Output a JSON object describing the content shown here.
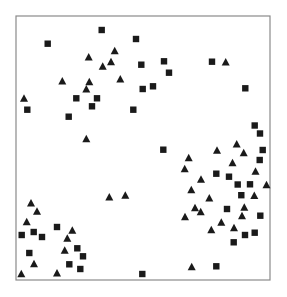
{
  "chart_data": {
    "type": "scatter",
    "title": "",
    "xlabel": "",
    "ylabel": "",
    "grid": false,
    "legend": null,
    "frame": {
      "left": 16,
      "top": 16,
      "right": 270,
      "bottom": 280,
      "stroke": "#8a8a8a"
    },
    "coordinate_system": "pixel (image coordinates, origin top-left)",
    "marker_color": "#1a1a1a",
    "series": [
      {
        "name": "squares",
        "marker": "square",
        "points": [
          [
            47.7,
            43.7
          ],
          [
            101.7,
            30
          ],
          [
            136,
            39
          ],
          [
            141.3,
            64.7
          ],
          [
            142.7,
            89
          ],
          [
            27.3,
            109.7
          ],
          [
            76.3,
            98.3
          ],
          [
            97,
            98.3
          ],
          [
            92,
            106.3
          ],
          [
            68.7,
            116.7
          ],
          [
            133.3,
            109.7
          ],
          [
            164,
            61.3
          ],
          [
            169,
            72.7
          ],
          [
            153,
            86.3
          ],
          [
            212,
            61.7
          ],
          [
            245.3,
            88.3
          ],
          [
            254.7,
            125.5
          ],
          [
            260,
            133.5
          ],
          [
            163.3,
            149.7
          ],
          [
            262.7,
            150
          ],
          [
            259.7,
            160
          ],
          [
            216.3,
            173.7
          ],
          [
            229,
            176.7
          ],
          [
            237.7,
            184.5
          ],
          [
            250,
            184.3
          ],
          [
            241.3,
            195.2
          ],
          [
            227,
            209
          ],
          [
            260.3,
            215.7
          ],
          [
            245,
            235
          ],
          [
            254.7,
            232.7
          ],
          [
            233.7,
            242.3
          ],
          [
            216.3,
            266.3
          ],
          [
            21.7,
            235
          ],
          [
            33.7,
            232
          ],
          [
            42,
            237
          ],
          [
            57,
            227
          ],
          [
            29.3,
            253
          ],
          [
            77.3,
            248.3
          ],
          [
            83,
            256.3
          ],
          [
            69.3,
            264.3
          ],
          [
            80.3,
            269
          ],
          [
            142.3,
            274
          ]
        ]
      },
      {
        "name": "triangles",
        "marker": "triangle",
        "points": [
          [
            88.7,
            57
          ],
          [
            114.7,
            50.7
          ],
          [
            111,
            61.7
          ],
          [
            102.7,
            66.3
          ],
          [
            62.3,
            81
          ],
          [
            89.3,
            81.7
          ],
          [
            86.3,
            89
          ],
          [
            120.3,
            79
          ],
          [
            24,
            98.3
          ],
          [
            86.3,
            138.7
          ],
          [
            225.7,
            62
          ],
          [
            188.7,
            157.7
          ],
          [
            217,
            150.3
          ],
          [
            236.7,
            144
          ],
          [
            243.7,
            152.8
          ],
          [
            184.7,
            168.7
          ],
          [
            232.5,
            162.7
          ],
          [
            201,
            179.3
          ],
          [
            255.5,
            171.2
          ],
          [
            266.5,
            184.8
          ],
          [
            191.3,
            189.7
          ],
          [
            254.3,
            195.5
          ],
          [
            209.3,
            198
          ],
          [
            195,
            207.7
          ],
          [
            200.7,
            211.7
          ],
          [
            185,
            216.7
          ],
          [
            244.3,
            207.3
          ],
          [
            242,
            215.7
          ],
          [
            221.3,
            222.3
          ],
          [
            211.3,
            229.7
          ],
          [
            234,
            227.7
          ],
          [
            191.7,
            266.7
          ],
          [
            109.3,
            197
          ],
          [
            125.3,
            195.3
          ],
          [
            31,
            203
          ],
          [
            37,
            211.3
          ],
          [
            26.7,
            221.7
          ],
          [
            72.3,
            230.3
          ],
          [
            67.3,
            238.3
          ],
          [
            64.7,
            250.3
          ],
          [
            34,
            263.7
          ],
          [
            21.3,
            273.7
          ],
          [
            57,
            273
          ]
        ]
      }
    ]
  }
}
